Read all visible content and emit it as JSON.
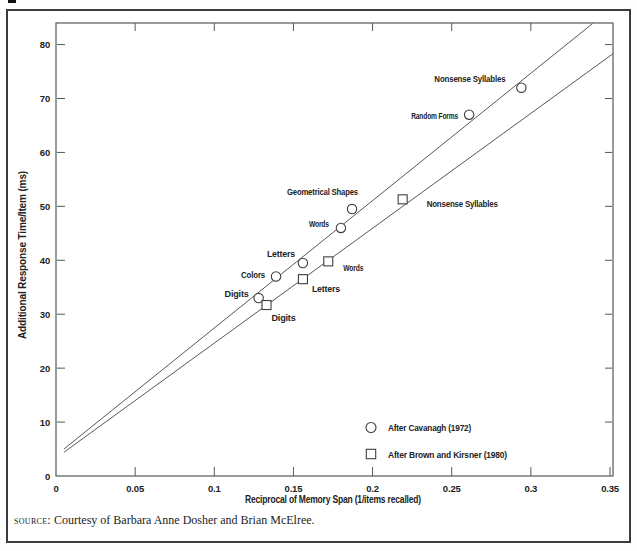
{
  "figure": {
    "source_label": "source:",
    "source_text": " Courtesy of Barbara Anne Dosher and Brian McElree."
  },
  "chart_data": {
    "type": "scatter",
    "title": "",
    "xlabel": "Reciprocal of Memory Span (1/items recalled)",
    "ylabel": "Additional Response Time/Item (ms)",
    "xlim": [
      0,
      0.35
    ],
    "ylim": [
      0,
      84
    ],
    "x_tick_labels": [
      "0",
      "0.05",
      "0.1",
      "0.15",
      "0.2",
      "0.25",
      "0.3",
      "0.35"
    ],
    "x_ticks": [
      0,
      0.05,
      0.1,
      0.15,
      0.2,
      0.25,
      0.3,
      0.35
    ],
    "y_ticks": [
      0,
      10,
      20,
      30,
      40,
      50,
      60,
      70,
      80
    ],
    "grid": false,
    "legend_position": "inside lower right",
    "series": [
      {
        "name": "After Cavanagh (1972)",
        "marker": "circle",
        "points": [
          {
            "label": "Digits",
            "x": 0.128,
            "y": 33
          },
          {
            "label": "Colors",
            "x": 0.139,
            "y": 37
          },
          {
            "label": "Letters",
            "x": 0.156,
            "y": 39.5
          },
          {
            "label": "Words",
            "x": 0.18,
            "y": 46
          },
          {
            "label": "Geometrical Shapes",
            "x": 0.187,
            "y": 49.5
          },
          {
            "label": "Random Forms",
            "x": 0.261,
            "y": 67
          },
          {
            "label": "Nonsense Syllables",
            "x": 0.294,
            "y": 72
          }
        ],
        "fit_line": {
          "x1": 0.005,
          "y1": 5.0,
          "x2": 0.339,
          "y2": 83.9
        }
      },
      {
        "name": "After Brown and Kirsner (1980)",
        "marker": "square",
        "points": [
          {
            "label": "Digits",
            "x": 0.133,
            "y": 31.7
          },
          {
            "label": "Letters",
            "x": 0.156,
            "y": 36.5
          },
          {
            "label": "Words",
            "x": 0.172,
            "y": 39.8
          },
          {
            "label": "Nonsense Syllables",
            "x": 0.219,
            "y": 51.3
          }
        ],
        "fit_line": {
          "x1": 0.005,
          "y1": 4.4,
          "x2": 0.3519,
          "y2": 78.3
        }
      }
    ],
    "colors": {
      "ink": "#222222",
      "plot_stroke": "#575757",
      "frame": "#3c3c3c"
    }
  }
}
